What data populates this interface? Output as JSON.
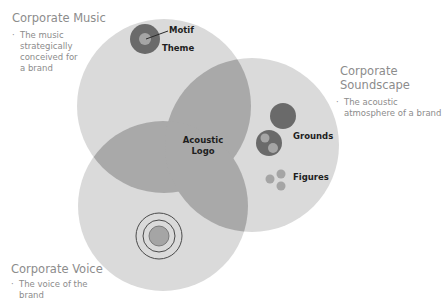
{
  "diagram": {
    "type": "venn",
    "colors": {
      "circle_fill": "#d9d9d9",
      "overlap_fill": "#a8a8a8",
      "dark_disc": "#6b6b6b",
      "mid_disc": "#9c9c9c",
      "ring_stroke": "#4a4a4a",
      "title_text": "#8c8c8c",
      "label_text": "#1e1e1e"
    },
    "sets": [
      {
        "id": "music",
        "title": "Corporate Music",
        "description": "The music strategically conceived for a brand",
        "elements": [
          "Motif",
          "Theme"
        ]
      },
      {
        "id": "soundscape",
        "title_line1": "Corporate",
        "title_line2": "Soundscape",
        "description": "The acoustic atmosphere of a brand",
        "elements": [
          "Grounds",
          "Figures"
        ]
      },
      {
        "id": "voice",
        "title": "Corporate Voice",
        "description": "The voice of the brand",
        "elements": []
      }
    ],
    "intersection": {
      "line1": "Acoustic",
      "line2": "Logo"
    }
  },
  "music": {
    "title": "Corporate Music",
    "bullet_lines": [
      "The music",
      "strategically",
      "conceived for",
      "a brand"
    ],
    "motif_label": "Motif",
    "theme_label": "Theme"
  },
  "soundscape": {
    "title_line1": "Corporate",
    "title_line2": "Soundscape",
    "bullet_lines": [
      "The acoustic",
      "atmosphere of a brand"
    ],
    "grounds_label": "Grounds",
    "figures_label": "Figures"
  },
  "voice": {
    "title": "Corporate Voice",
    "bullet_lines": [
      "The voice of the",
      "brand"
    ]
  },
  "center": {
    "line1": "Acoustic",
    "line2": "Logo"
  }
}
